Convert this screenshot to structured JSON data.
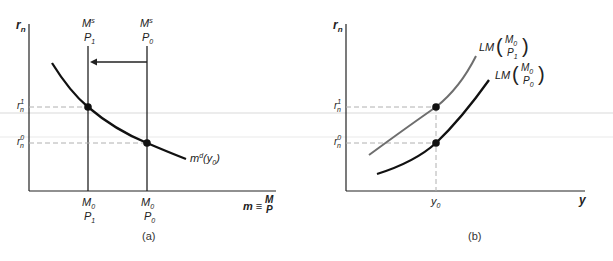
{
  "panel_a": {
    "caption": "(a)",
    "y_axis_label": "r",
    "y_axis_sub": "n",
    "x_axis_label": "m ≡",
    "x_axis_frac_num": "M",
    "x_axis_frac_den": "P",
    "supply_new": {
      "num": "M",
      "sup": "s",
      "den": "P",
      "den_sub": "1"
    },
    "supply_old": {
      "num": "M",
      "sup": "s",
      "den": "P",
      "den_sub": "0"
    },
    "tick_new": {
      "num": "M",
      "num_sub": "0",
      "den": "P",
      "den_sub": "1"
    },
    "tick_old": {
      "num": "M",
      "num_sub": "0",
      "den": "P",
      "den_sub": "0"
    },
    "r1": {
      "base": "r",
      "sub": "n",
      "sup": "1"
    },
    "r0": {
      "base": "r",
      "sub": "n",
      "sup": "0"
    },
    "demand_label": {
      "base": "m",
      "sup": "d",
      "arg": "(y",
      "arg_sub": "0",
      "close": ")"
    }
  },
  "panel_b": {
    "caption": "(b)",
    "y_axis_label": "r",
    "y_axis_sub": "n",
    "x_axis_label": "y",
    "y0": {
      "base": "y",
      "sub": "0"
    },
    "r1": {
      "base": "r",
      "sub": "n",
      "sup": "1"
    },
    "r0": {
      "base": "r",
      "sub": "n",
      "sup": "0"
    },
    "lm_new": {
      "prefix": "LM",
      "num": "M",
      "num_sub": "0",
      "den": "P",
      "den_sub": "1"
    },
    "lm_old": {
      "prefix": "LM",
      "num": "M",
      "num_sub": "0",
      "den": "P",
      "den_sub": "0"
    }
  },
  "colors": {
    "ink": "#111111",
    "gray_curve": "#6e6e6e",
    "dash": "#b0b0b0"
  }
}
